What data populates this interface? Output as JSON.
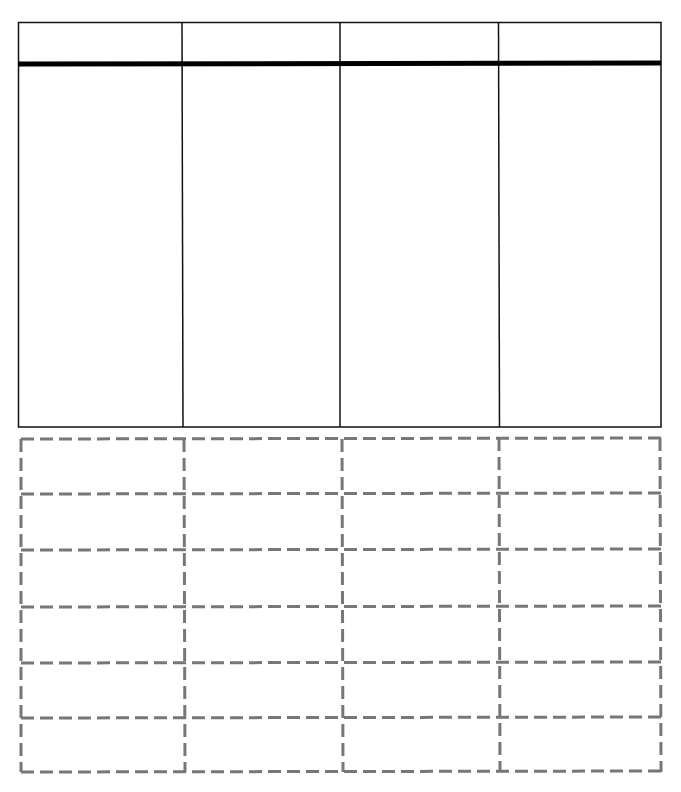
{
  "worksheet": {
    "top_table": {
      "columns": 4,
      "header_cells": [
        "",
        "",
        "",
        ""
      ],
      "body_cells": [
        "",
        "",
        "",
        ""
      ],
      "border_color": "#111111",
      "header_rule_color": "#000000"
    },
    "dashed_grid": {
      "columns": 4,
      "rows": 6,
      "cells": [
        [
          "",
          "",
          "",
          ""
        ],
        [
          "",
          "",
          "",
          ""
        ],
        [
          "",
          "",
          "",
          ""
        ],
        [
          "",
          "",
          "",
          ""
        ],
        [
          "",
          "",
          "",
          ""
        ],
        [
          "",
          "",
          "",
          ""
        ]
      ],
      "line_color": "#777777"
    }
  }
}
